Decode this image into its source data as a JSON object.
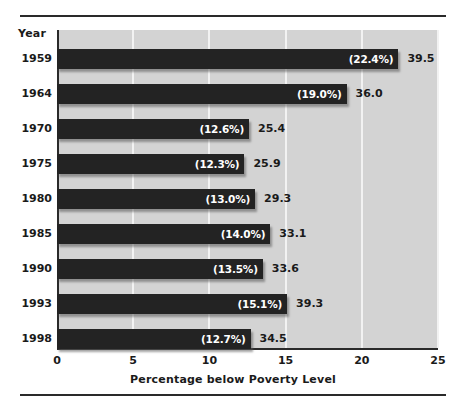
{
  "chart_data": {
    "type": "bar",
    "orientation": "horizontal",
    "title": "",
    "xlabel": "Percentage below Poverty Level",
    "ylabel": "Year",
    "categories": [
      "1959",
      "1964",
      "1970",
      "1975",
      "1980",
      "1985",
      "1990",
      "1993",
      "1998"
    ],
    "values": [
      22.4,
      19.0,
      12.6,
      12.3,
      13.0,
      14.0,
      13.5,
      15.1,
      12.7
    ],
    "percent_labels": [
      "(22.4%)",
      "(19.0%)",
      "(12.6%)",
      "(12.3%)",
      "(13.0%)",
      "(14.0%)",
      "(13.5%)",
      "(15.1%)",
      "(12.7%)"
    ],
    "count_labels": [
      "39.5",
      "36.0",
      "25.4",
      "25.9",
      "29.3",
      "33.1",
      "33.6",
      "39.3",
      "34.5"
    ],
    "counts": [
      39.5,
      36.0,
      25.4,
      25.9,
      29.3,
      33.1,
      33.6,
      39.3,
      34.5
    ],
    "xlim": [
      0,
      25
    ],
    "xticks": [
      0,
      5,
      10,
      15,
      20,
      25
    ],
    "xtick_labels": [
      "0",
      "5",
      "10",
      "15",
      "20",
      "25"
    ],
    "grid": true,
    "grid_axis": "x",
    "legend": null,
    "bar_color": "#232323",
    "plot_background": "#d3d3d3",
    "grid_color": "#f2f2f2",
    "axis_color": "#2a2a2a",
    "label_text_color": "#ffffff"
  },
  "axes": {
    "year_header": "Year"
  }
}
